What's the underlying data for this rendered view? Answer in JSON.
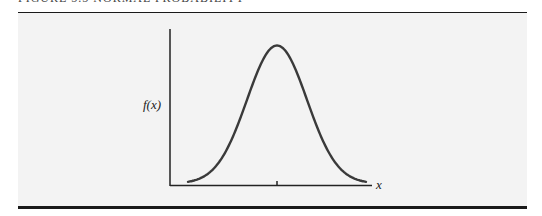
{
  "figure": {
    "caption": "FIGURE 5.5   NORMAL PROBABILITY",
    "y_label": "f(x)",
    "x_label": "x"
  },
  "chart_data": {
    "type": "line",
    "xlabel": "x",
    "ylabel": "f(x)",
    "grid": false,
    "legend": null,
    "tick_marks": [
      {
        "axis": "x",
        "position": "mean",
        "label": ""
      }
    ],
    "series": [
      {
        "name": "f(x)",
        "shape": "normal density, symmetric about the mean",
        "x": [
          -3,
          -2.5,
          -2,
          -1.5,
          -1,
          -0.5,
          0,
          0.5,
          1,
          1.5,
          2,
          2.5,
          3
        ],
        "values": [
          0.004,
          0.018,
          0.054,
          0.13,
          0.242,
          0.352,
          0.399,
          0.352,
          0.242,
          0.13,
          0.054,
          0.018,
          0.004
        ]
      }
    ]
  },
  "colors": {
    "panel_background": "#f3f3f3",
    "rules": "#1a1a1a",
    "axes": "#222222",
    "curve": "#3a3a3a"
  }
}
